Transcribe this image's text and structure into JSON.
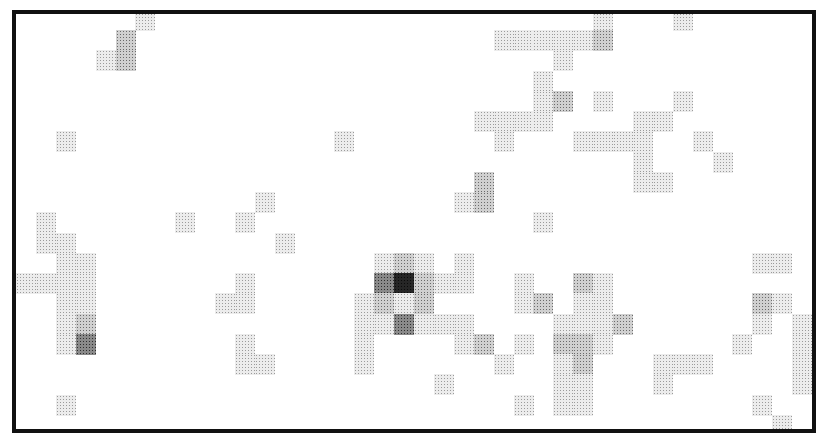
{
  "chart_data": {
    "type": "heatmap",
    "title": "",
    "xlabel": "",
    "ylabel": "",
    "grid": false,
    "legend": null,
    "cols": 40,
    "rows": 21,
    "value_scale": "0 = white, 1 = light dither, 2 = medium, 3 = dark, 4 = darkest",
    "cells": [
      [
        0,
        6,
        1
      ],
      [
        0,
        29,
        1
      ],
      [
        0,
        33,
        1
      ],
      [
        1,
        5,
        2
      ],
      [
        1,
        24,
        1
      ],
      [
        1,
        25,
        1
      ],
      [
        1,
        26,
        1
      ],
      [
        1,
        27,
        1
      ],
      [
        1,
        28,
        1
      ],
      [
        1,
        29,
        2
      ],
      [
        2,
        4,
        1
      ],
      [
        2,
        5,
        2
      ],
      [
        2,
        27,
        1
      ],
      [
        3,
        26,
        1
      ],
      [
        4,
        26,
        1
      ],
      [
        4,
        27,
        2
      ],
      [
        4,
        29,
        1
      ],
      [
        4,
        33,
        1
      ],
      [
        5,
        23,
        1
      ],
      [
        5,
        24,
        1
      ],
      [
        5,
        25,
        1
      ],
      [
        5,
        26,
        1
      ],
      [
        5,
        31,
        1
      ],
      [
        5,
        32,
        1
      ],
      [
        6,
        2,
        1
      ],
      [
        6,
        16,
        1
      ],
      [
        6,
        24,
        1
      ],
      [
        6,
        28,
        1
      ],
      [
        6,
        29,
        1
      ],
      [
        6,
        30,
        1
      ],
      [
        6,
        31,
        1
      ],
      [
        6,
        34,
        1
      ],
      [
        7,
        31,
        1
      ],
      [
        7,
        35,
        1
      ],
      [
        8,
        23,
        2
      ],
      [
        8,
        31,
        1
      ],
      [
        8,
        32,
        1
      ],
      [
        9,
        12,
        1
      ],
      [
        9,
        22,
        1
      ],
      [
        9,
        23,
        2
      ],
      [
        10,
        1,
        1
      ],
      [
        10,
        8,
        1
      ],
      [
        10,
        11,
        1
      ],
      [
        10,
        26,
        1
      ],
      [
        11,
        1,
        1
      ],
      [
        11,
        2,
        1
      ],
      [
        11,
        13,
        1
      ],
      [
        12,
        2,
        1
      ],
      [
        12,
        3,
        1
      ],
      [
        12,
        18,
        1
      ],
      [
        12,
        19,
        2
      ],
      [
        12,
        20,
        1
      ],
      [
        12,
        22,
        1
      ],
      [
        12,
        37,
        1
      ],
      [
        12,
        38,
        1
      ],
      [
        13,
        0,
        1
      ],
      [
        13,
        1,
        1
      ],
      [
        13,
        2,
        1
      ],
      [
        13,
        3,
        1
      ],
      [
        13,
        11,
        1
      ],
      [
        13,
        18,
        3
      ],
      [
        13,
        19,
        4
      ],
      [
        13,
        20,
        2
      ],
      [
        13,
        21,
        1
      ],
      [
        13,
        22,
        1
      ],
      [
        13,
        25,
        1
      ],
      [
        13,
        28,
        2
      ],
      [
        13,
        29,
        1
      ],
      [
        14,
        2,
        1
      ],
      [
        14,
        3,
        1
      ],
      [
        14,
        10,
        1
      ],
      [
        14,
        11,
        1
      ],
      [
        14,
        17,
        1
      ],
      [
        14,
        18,
        2
      ],
      [
        14,
        19,
        1
      ],
      [
        14,
        20,
        2
      ],
      [
        14,
        25,
        1
      ],
      [
        14,
        26,
        2
      ],
      [
        14,
        28,
        1
      ],
      [
        14,
        29,
        1
      ],
      [
        14,
        37,
        2
      ],
      [
        14,
        38,
        1
      ],
      [
        15,
        2,
        1
      ],
      [
        15,
        3,
        2
      ],
      [
        15,
        17,
        1
      ],
      [
        15,
        18,
        1
      ],
      [
        15,
        19,
        3
      ],
      [
        15,
        20,
        1
      ],
      [
        15,
        21,
        1
      ],
      [
        15,
        22,
        1
      ],
      [
        15,
        27,
        1
      ],
      [
        15,
        28,
        1
      ],
      [
        15,
        29,
        1
      ],
      [
        15,
        30,
        2
      ],
      [
        15,
        37,
        1
      ],
      [
        15,
        39,
        1
      ],
      [
        16,
        2,
        1
      ],
      [
        16,
        3,
        3
      ],
      [
        16,
        11,
        1
      ],
      [
        16,
        17,
        1
      ],
      [
        16,
        22,
        1
      ],
      [
        16,
        23,
        2
      ],
      [
        16,
        25,
        1
      ],
      [
        16,
        27,
        2
      ],
      [
        16,
        28,
        2
      ],
      [
        16,
        29,
        1
      ],
      [
        16,
        36,
        1
      ],
      [
        16,
        39,
        1
      ],
      [
        17,
        11,
        1
      ],
      [
        17,
        12,
        1
      ],
      [
        17,
        17,
        1
      ],
      [
        17,
        24,
        1
      ],
      [
        17,
        27,
        1
      ],
      [
        17,
        28,
        2
      ],
      [
        17,
        32,
        1
      ],
      [
        17,
        33,
        1
      ],
      [
        17,
        34,
        1
      ],
      [
        17,
        39,
        1
      ],
      [
        18,
        21,
        1
      ],
      [
        18,
        27,
        1
      ],
      [
        18,
        28,
        1
      ],
      [
        18,
        32,
        1
      ],
      [
        18,
        39,
        1
      ],
      [
        19,
        2,
        1
      ],
      [
        19,
        25,
        1
      ],
      [
        19,
        27,
        1
      ],
      [
        19,
        28,
        1
      ],
      [
        19,
        37,
        1
      ],
      [
        20,
        38,
        1
      ]
    ]
  },
  "palette": {
    "1": {
      "dot": "#9a9a9a",
      "bg": "#ececec"
    },
    "2": {
      "dot": "#6a6a6a",
      "bg": "#d0d0d0"
    },
    "3": {
      "dot": "#2e2e2e",
      "bg": "#8a8a8a"
    },
    "4": {
      "dot": "#0a0a0a",
      "bg": "#262626"
    }
  },
  "frame": {
    "border_color": "#111111"
  }
}
